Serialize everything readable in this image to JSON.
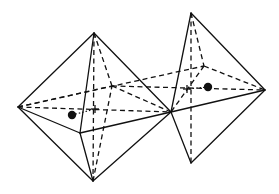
{
  "diagram": {
    "type": "two-edge-sharing-octahedra",
    "colors": {
      "line": "#111111",
      "background": "#ffffff"
    },
    "octahedra": [
      {
        "name": "left-octahedron",
        "vertices": {
          "top": [
            94,
            33
          ],
          "left": [
            18,
            107
          ],
          "bottom": [
            93,
            181
          ],
          "front": [
            80,
            133
          ],
          "back": [
            112,
            86
          ],
          "right": [
            171,
            112
          ]
        },
        "solid_edges": [
          [
            "top",
            "left"
          ],
          [
            "top",
            "front"
          ],
          [
            "top",
            "right"
          ],
          [
            "left",
            "front"
          ],
          [
            "left",
            "bottom"
          ],
          [
            "front",
            "bottom"
          ],
          [
            "front",
            "right"
          ],
          [
            "bottom",
            "right"
          ]
        ],
        "dashed_edges": [
          [
            "top",
            "back"
          ],
          [
            "left",
            "back"
          ],
          [
            "bottom",
            "back"
          ],
          [
            "back",
            "right"
          ],
          [
            "left",
            "right"
          ],
          [
            "top",
            "bottom"
          ]
        ],
        "off_center_marker": {
          "dot": [
            72,
            115
          ],
          "plus": [
            95,
            109
          ]
        }
      },
      {
        "name": "right-octahedron",
        "vertices": {
          "top": [
            191,
            13
          ],
          "right": [
            265,
            90
          ],
          "bottom": [
            191,
            163
          ],
          "left": [
            171,
            112
          ],
          "back": [
            204,
            66
          ]
        },
        "solid_edges": [
          [
            "top",
            "left"
          ],
          [
            "top",
            "right"
          ],
          [
            "right",
            "bottom"
          ],
          [
            "left",
            "bottom"
          ],
          [
            "left",
            "right"
          ]
        ],
        "dashed_edges": [
          [
            "top",
            "back"
          ],
          [
            "back",
            "right"
          ],
          [
            "back",
            "left"
          ],
          [
            "top",
            "bottom"
          ]
        ],
        "off_center_marker": {
          "dot": [
            208,
            87
          ],
          "plus": [
            187,
            89
          ]
        }
      }
    ],
    "cross_dashed_edges": [
      [
        [
          18,
          107
        ],
        [
          204,
          66
        ]
      ],
      [
        [
          112,
          86
        ],
        [
          265,
          90
        ]
      ]
    ],
    "legend": {
      "dot": "metal-atom",
      "plus": "octahedron-center"
    }
  }
}
